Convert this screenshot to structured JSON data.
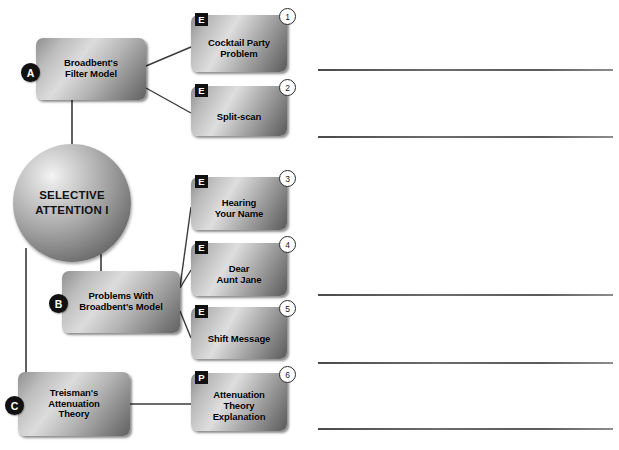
{
  "page": {
    "width": 619,
    "height": 450,
    "background_color": "#ffffff"
  },
  "central_node": {
    "name": "central-sphere",
    "label": "SELECTIVE\nATTENTION I",
    "line1": "SELECTIVE",
    "line2": "ATTENTION I",
    "shape": "sphere",
    "x": 13,
    "y": 144,
    "diameter": 118
  },
  "main_nodes": [
    {
      "id": "A",
      "badge_letter": "A",
      "label_line1": "Broadbent's",
      "label_line2": "Filter Model",
      "x": 36,
      "y": 38,
      "width": 110,
      "height": 62
    },
    {
      "id": "B",
      "badge_letter": "B",
      "label_line1": "Problems With",
      "label_line2": "Broadbent's Model",
      "x": 62,
      "y": 271,
      "width": 118,
      "height": 62
    },
    {
      "id": "C",
      "badge_letter": "C",
      "label_line1": "Treisman's",
      "label_line2": "Attenuation",
      "label_line3": "Theory",
      "x": 18,
      "y": 372,
      "width": 112,
      "height": 64
    }
  ],
  "sub_nodes": [
    {
      "number": "1",
      "type_badge": "E",
      "label_line1": "Cocktail Party",
      "label_line2": "Problem",
      "x": 191,
      "y": 15,
      "width": 96,
      "height": 57,
      "parent": "A"
    },
    {
      "number": "2",
      "type_badge": "E",
      "label_line1": "Split-scan",
      "label_line2": "",
      "x": 191,
      "y": 86,
      "width": 96,
      "height": 50,
      "parent": "A"
    },
    {
      "number": "3",
      "type_badge": "E",
      "label_line1": "Hearing",
      "label_line2": "Your Name",
      "x": 191,
      "y": 177,
      "width": 96,
      "height": 53,
      "parent": "B"
    },
    {
      "number": "4",
      "type_badge": "E",
      "label_line1": "Dear",
      "label_line2": "Aunt Jane",
      "x": 191,
      "y": 243,
      "width": 96,
      "height": 53,
      "parent": "B"
    },
    {
      "number": "5",
      "type_badge": "E",
      "label_line1": "Shift Message",
      "label_line2": "",
      "x": 191,
      "y": 307,
      "width": 96,
      "height": 52,
      "parent": "B"
    },
    {
      "number": "6",
      "type_badge": "P",
      "label_line1": "Attenuation",
      "label_line2": "Theory",
      "label_line3": "Explanation",
      "x": 191,
      "y": 373,
      "width": 96,
      "height": 58,
      "parent": "C"
    }
  ],
  "note_lines": [
    {
      "id": "note-line-1",
      "x": 318,
      "y": 69,
      "width": 295
    },
    {
      "id": "note-line-2",
      "x": 318,
      "y": 136,
      "width": 295
    },
    {
      "id": "note-line-3",
      "x": 318,
      "y": 294,
      "width": 295
    },
    {
      "id": "note-line-4",
      "x": 318,
      "y": 362,
      "width": 295
    },
    {
      "id": "note-line-5",
      "x": 318,
      "y": 428,
      "width": 295
    }
  ],
  "connectors": [
    {
      "from": "central-sphere",
      "to": "A"
    },
    {
      "from": "central-sphere",
      "to": "B"
    },
    {
      "from": "central-sphere",
      "to": "C"
    },
    {
      "from": "A",
      "to": "1"
    },
    {
      "from": "A",
      "to": "2"
    },
    {
      "from": "B",
      "to": "3"
    },
    {
      "from": "B",
      "to": "4"
    },
    {
      "from": "B",
      "to": "5"
    },
    {
      "from": "C",
      "to": "6"
    }
  ],
  "colors": {
    "badge_background": "#111111",
    "badge_text": "#ffffff",
    "line": "#3a3a3a",
    "node_text": "#000000",
    "page_background": "#ffffff"
  }
}
